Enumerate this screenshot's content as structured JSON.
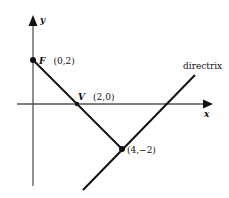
{
  "diagram": {
    "type": "parabola-focus-directrix",
    "axes": {
      "x_label": "x",
      "y_label": "y"
    },
    "points": {
      "focus": {
        "name": "F",
        "coords": "(0,2)",
        "label_name": "F",
        "label_coords": "(0,2)"
      },
      "vertex": {
        "name": "V",
        "coords": "(2,0)",
        "label_name": "V",
        "label_coords": "(2,0)"
      },
      "point": {
        "name": "",
        "coords": "(4,−2)",
        "label": "(4,−2)"
      }
    },
    "lines": {
      "directrix_label": "directrix"
    },
    "colors": {
      "line": "#111111",
      "axis": "#555555",
      "background": "#ffffff"
    }
  }
}
